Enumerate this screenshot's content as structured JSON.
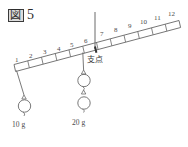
{
  "figure": {
    "label_box_char": "図",
    "label_number": "5",
    "caption": "図 5"
  },
  "diagram": {
    "type": "lever-balance",
    "beam": {
      "divisions": 12,
      "tick_labels": [
        "1",
        "2",
        "3",
        "4",
        "5",
        "6",
        "7",
        "8",
        "9",
        "10",
        "11",
        "12"
      ],
      "tilt": "left-end-low-right-end-high",
      "stroke_color": "#555555"
    },
    "fulcrum": {
      "label": "支点",
      "position_index": 6,
      "support_line": "vertical"
    },
    "weights": [
      {
        "id": "left-weight",
        "label": "10 g",
        "mass_value": "10",
        "unit": "g",
        "hang_position_index": 1,
        "count": 1
      },
      {
        "id": "right-weight",
        "label": "20 g",
        "mass_value": "20",
        "unit": "g",
        "hang_position_index": 6,
        "count": 2
      }
    ]
  },
  "colors": {
    "background": "#ffffff",
    "ink": "#555555",
    "text": "#4a4a4a"
  }
}
